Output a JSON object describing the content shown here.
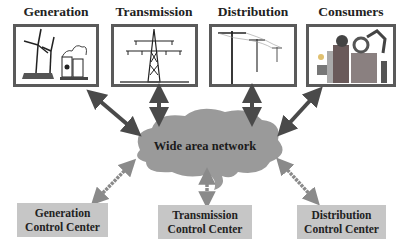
{
  "top_row": [
    {
      "title": "Generation",
      "icon": "wind-turbine-power-plant-icon"
    },
    {
      "title": "Transmission",
      "icon": "transmission-tower-icon"
    },
    {
      "title": "Distribution",
      "icon": "utility-poles-icon"
    },
    {
      "title": "Consumers",
      "icon": "industrial-consumers-icon"
    }
  ],
  "network": {
    "label": "Wide area network"
  },
  "control_centers": [
    {
      "line1": "Generation",
      "line2": "Control Center"
    },
    {
      "line1": "Transmission",
      "line2": "Control Center"
    },
    {
      "line1": "Distribution",
      "line2": "Control Center"
    }
  ],
  "colors": {
    "box_border": "#5a5a5a",
    "cloud": "#9a9a9a",
    "arrow_dark": "#4a4a4a",
    "arrow_dashed": "#8a8a8a",
    "control_center_bg": "#c6c6c6"
  }
}
